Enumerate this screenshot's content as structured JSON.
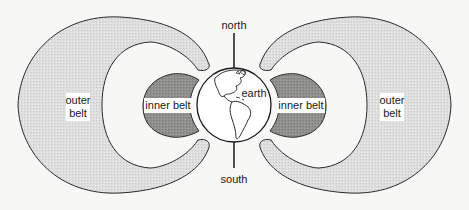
{
  "diagram": {
    "type": "Van Allen radiation belts cross-section",
    "labels": {
      "north": "north",
      "south": "south",
      "earth": "earth",
      "inner_belt_left": "inner belt",
      "inner_belt_right": "inner belt",
      "outer_belt_left_line1": "outer",
      "outer_belt_left_line2": "belt",
      "outer_belt_right_line1": "outer",
      "outer_belt_right_line2": "belt"
    },
    "colors": {
      "background": "#f7f7f5",
      "outer_belt_fill": "#dcdcda",
      "inner_belt_fill": "#8e8e8c",
      "gap_fill": "#ffffff",
      "outline": "#2a2a2a"
    }
  }
}
